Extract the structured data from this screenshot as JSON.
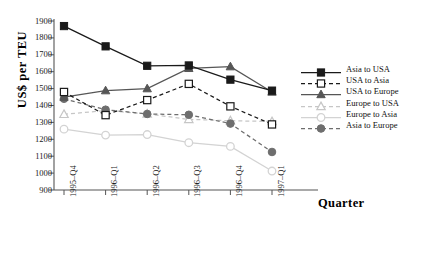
{
  "chart_data": {
    "type": "line",
    "title": "",
    "xlabel": "Quarter",
    "ylabel": "US$ per TEU",
    "ylim": [
      900,
      1900
    ],
    "ytick_step": 100,
    "yticks": [
      "1900",
      "1800",
      "1700",
      "1600",
      "1500",
      "1400",
      "1300",
      "1200",
      "1100",
      "1000",
      "900"
    ],
    "grid": false,
    "legend_position": "right",
    "categories": [
      "1995–Q4",
      "1996–Q1",
      "1996–Q2",
      "1996–Q3",
      "1996–Q4",
      "1997–Q1"
    ],
    "series": [
      {
        "name": "Asia to USA",
        "values": [
          1870,
          1750,
          1635,
          1637,
          1553,
          1488
        ],
        "color": "#1a1a1a",
        "marker": "filled-square",
        "line": "solid"
      },
      {
        "name": "USA to Asia",
        "values": [
          1480,
          1343,
          1432,
          1528,
          1395,
          1288
        ],
        "color": "#1a1a1a",
        "marker": "open-square",
        "line": "dashed"
      },
      {
        "name": "USA to Europe",
        "values": [
          1450,
          1488,
          1500,
          1620,
          1630,
          1480
        ],
        "color": "#565656",
        "marker": "filled-triangle",
        "line": "solid"
      },
      {
        "name": "Europe to USA",
        "values": [
          1348,
          1370,
          1350,
          1318,
          1310,
          1305
        ],
        "color": "#c6c6c6",
        "marker": "open-triangle",
        "line": "dashed"
      },
      {
        "name": "Europe to Asia",
        "values": [
          1260,
          1225,
          1228,
          1180,
          1158,
          1012
        ],
        "color": "#d3d3d3",
        "marker": "open-circle",
        "line": "solid"
      },
      {
        "name": "Asia to Europe",
        "values": [
          1440,
          1375,
          1350,
          1345,
          1293,
          1125
        ],
        "color": "#6e6e6e",
        "marker": "filled-circle",
        "line": "dashed"
      }
    ]
  },
  "axis": {
    "y_title": "US$ per TEU",
    "x_title": "Quarter"
  },
  "legend": {
    "entries": [
      "Asia to USA",
      "USA to Asia",
      "USA to Europe",
      "Europe to USA",
      "Europe to Asia",
      "Asia to Europe"
    ]
  },
  "caption": ""
}
